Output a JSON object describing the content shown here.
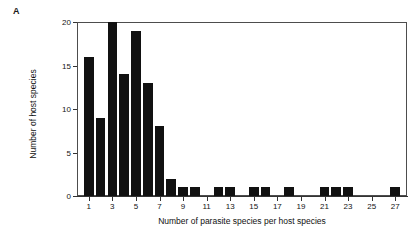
{
  "figure": {
    "panel_label": "A",
    "background_color": "#ffffff",
    "bar_color": "#111111",
    "axis_color": "#333333",
    "frame_color": "#4d4d4d"
  },
  "chart_data": {
    "type": "bar",
    "title": "",
    "subtitle": "",
    "xlabel": "Number of parasite species per host species",
    "ylabel": "Number of host species",
    "annotations": [
      "A"
    ],
    "legend": [],
    "legend_position": "none",
    "grid": false,
    "xlim": [
      0,
      28
    ],
    "ylim": [
      0,
      20
    ],
    "x_tick_values": [
      1,
      3,
      5,
      7,
      9,
      11,
      13,
      15,
      17,
      19,
      21,
      23,
      25,
      27
    ],
    "x_tick_labels": [
      "1",
      "3",
      "5",
      "7",
      "9",
      "11",
      "13",
      "15",
      "17",
      "19",
      "21",
      "23",
      "25",
      "27"
    ],
    "y_tick_values": [
      0,
      5,
      10,
      15,
      20
    ],
    "y_tick_labels": [
      "0",
      "5",
      "10",
      "15",
      "20"
    ],
    "categories": [
      1,
      2,
      3,
      4,
      5,
      6,
      7,
      8,
      9,
      10,
      11,
      12,
      13,
      14,
      15,
      16,
      17,
      18,
      19,
      20,
      21,
      22,
      23,
      24,
      25,
      26,
      27
    ],
    "values": [
      16,
      9,
      20,
      14,
      19,
      13,
      8,
      2,
      1,
      1,
      0,
      1,
      1,
      0,
      1,
      1,
      0,
      1,
      0,
      0,
      1,
      1,
      1,
      0,
      0,
      0,
      1
    ]
  }
}
